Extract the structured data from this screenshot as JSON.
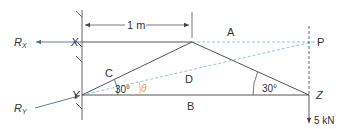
{
  "diagram": {
    "type": "pin-jointed frame / force diagram",
    "colors": {
      "member": "#555555",
      "wall": "#666666",
      "construction_dashed": "#8fc7d6",
      "reaction_line": "#4a6d8c",
      "angle_theta": "#f0a040",
      "vertical_dashed": "#444444"
    },
    "nodes": {
      "X": {
        "label": "X"
      },
      "Y": {
        "label": "Y"
      },
      "Z": {
        "label": "Z"
      },
      "P": {
        "label": "P"
      }
    },
    "members": {
      "A": "A",
      "B": "B",
      "C": "C",
      "D": "D"
    },
    "reactions": {
      "rx_main": "R",
      "rx_sub": "X",
      "ry_main": "R",
      "ry_sub": "Y"
    },
    "dimension": "1 m",
    "angles": {
      "at_y": "30°",
      "at_z": "30°",
      "theta": "θ"
    },
    "load": "5 kN"
  }
}
